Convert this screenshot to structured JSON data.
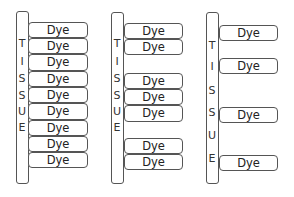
{
  "diagram": {
    "columns": [
      {
        "label_letters": [
          "T",
          "I",
          "S",
          "S",
          "U",
          "E"
        ],
        "dye_boxes": [
          "Dye",
          "Dye",
          "Dye",
          "Dye",
          "Dye",
          "Dye",
          "Dye",
          "Dye",
          "Dye"
        ]
      },
      {
        "label_letters": [
          "T",
          "I",
          "S",
          "S",
          "U",
          "E"
        ],
        "dye_boxes": [
          "Dye",
          "Dye",
          "Dye",
          "Dye",
          "Dye",
          "Dye",
          "Dye"
        ]
      },
      {
        "label_letters": [
          "T",
          "I",
          "S",
          "S",
          "U",
          "E"
        ],
        "dye_boxes": [
          "Dye",
          "Dye",
          "Dye",
          "Dye"
        ]
      }
    ]
  }
}
